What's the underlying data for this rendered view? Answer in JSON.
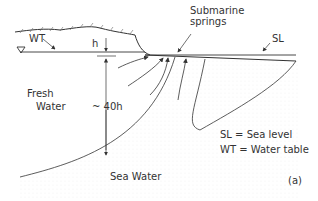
{
  "labels": {
    "wt": "WT",
    "h": "h",
    "submarine1": "Submarine",
    "submarine2": "springs",
    "sl": "SL",
    "fresh1": "Fresh",
    "fresh2": "Water",
    "depth": "~ 40h",
    "legend_sl": "SL = Sea level",
    "legend_wt": "WT = Water table",
    "sea_water": "Sea Water",
    "panel": "(a)"
  }
}
